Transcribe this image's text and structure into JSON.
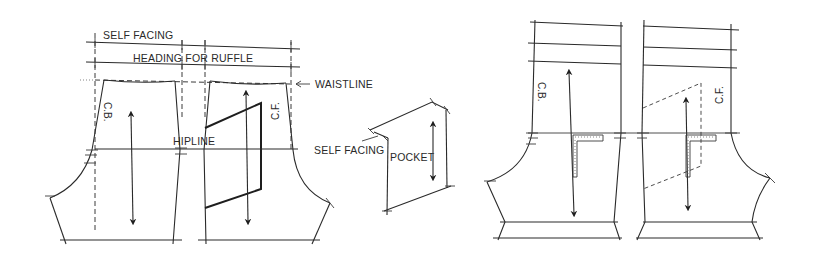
{
  "figure": {
    "left_pattern": {
      "labels": {
        "self_facing": "SELF FACING",
        "heading_for_ruffle": "HEADING FOR RUFFLE",
        "waistline": "WAISTLINE",
        "hipline": "HIPLINE",
        "back_piece_label": "C.B.",
        "front_piece_label": "C.F."
      }
    },
    "pocket": {
      "labels": {
        "self_facing": "SELF FACING",
        "pocket": "POCKET"
      }
    },
    "right_pattern": {
      "labels": {
        "back_piece_label": "C.B.",
        "front_piece_label": "C.F."
      }
    },
    "colors": {
      "line": "#2a2a2a",
      "background": "#ffffff"
    }
  }
}
